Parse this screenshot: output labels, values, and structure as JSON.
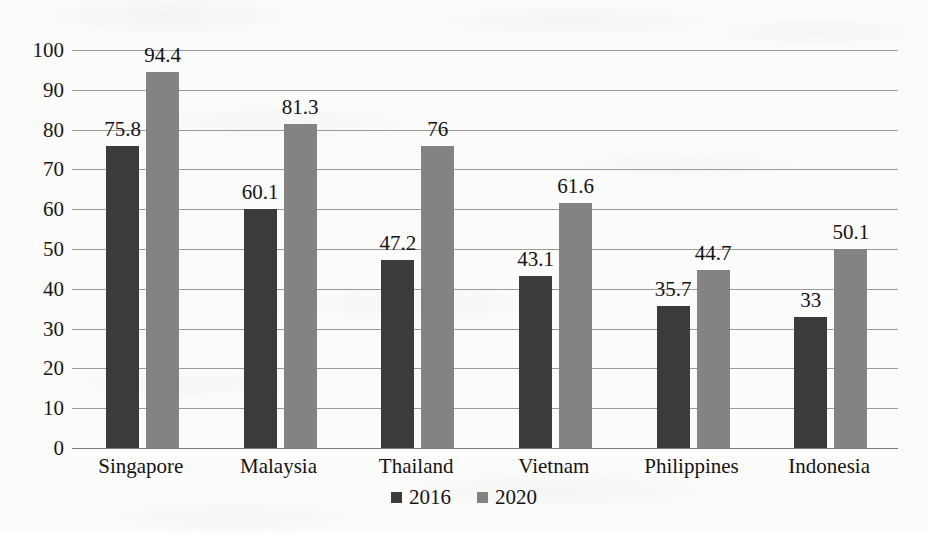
{
  "chart_data": {
    "type": "bar",
    "title": "",
    "subtitle": "",
    "xlabel": "",
    "ylabel": "",
    "categories": [
      "Singapore",
      "Malaysia",
      "Thailand",
      "Vietnam",
      "Philippines",
      "Indonesia"
    ],
    "series": [
      {
        "name": "2016",
        "color": "#3b3b3b",
        "values": [
          75.8,
          60.1,
          47.2,
          43.1,
          35.7,
          33
        ],
        "labels": [
          "75.8",
          "60.1",
          "47.2",
          "43.1",
          "35.7",
          "33"
        ]
      },
      {
        "name": "2020",
        "color": "#838383",
        "values": [
          94.4,
          81.3,
          76,
          61.6,
          44.7,
          50.1
        ],
        "labels": [
          "94.4",
          "81.3",
          "76",
          "61.6",
          "44.7",
          "50.1"
        ]
      }
    ],
    "ylim": [
      0,
      100
    ],
    "ytick_step": 10,
    "yticks": [
      100,
      90,
      80,
      70,
      60,
      50,
      40,
      30,
      20,
      10,
      0
    ],
    "ytick_labels": [
      "100",
      "90",
      "80",
      "70",
      "60",
      "50",
      "40",
      "30",
      "20",
      "10",
      "0"
    ],
    "grid": true,
    "grid_axis": "y",
    "legend_position": "bottom",
    "legend_entries": [
      "2016",
      "2020"
    ],
    "data_labels_shown": true
  },
  "colors": {
    "series_2016": "#3b3b3b",
    "series_2020": "#838383",
    "gridline": "#9a9a9a",
    "axis": "#7d7d7d",
    "background": "#fbfbfa",
    "text": "#141414"
  }
}
